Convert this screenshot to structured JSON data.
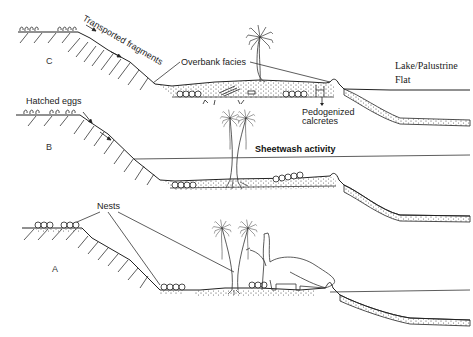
{
  "figure": {
    "panels": [
      {
        "id": "C",
        "label": "C"
      },
      {
        "id": "B",
        "label": "B"
      },
      {
        "id": "A",
        "label": "A"
      }
    ],
    "annotations": {
      "transported_fragments": "Transported fragments",
      "overbank_facies": "Overbank facies",
      "lake_palustrine": "Lake/Palustrine",
      "flat": "Flat",
      "pedogenized": "Pedogenized",
      "calcretes": "calcretes",
      "hatched_eggs": "Hatched eggs",
      "sheetwash_activity": "Sheetwash activity",
      "nests": "Nests"
    },
    "colors": {
      "line": "#222222",
      "background": "#ffffff",
      "stipple": "#444444"
    }
  }
}
